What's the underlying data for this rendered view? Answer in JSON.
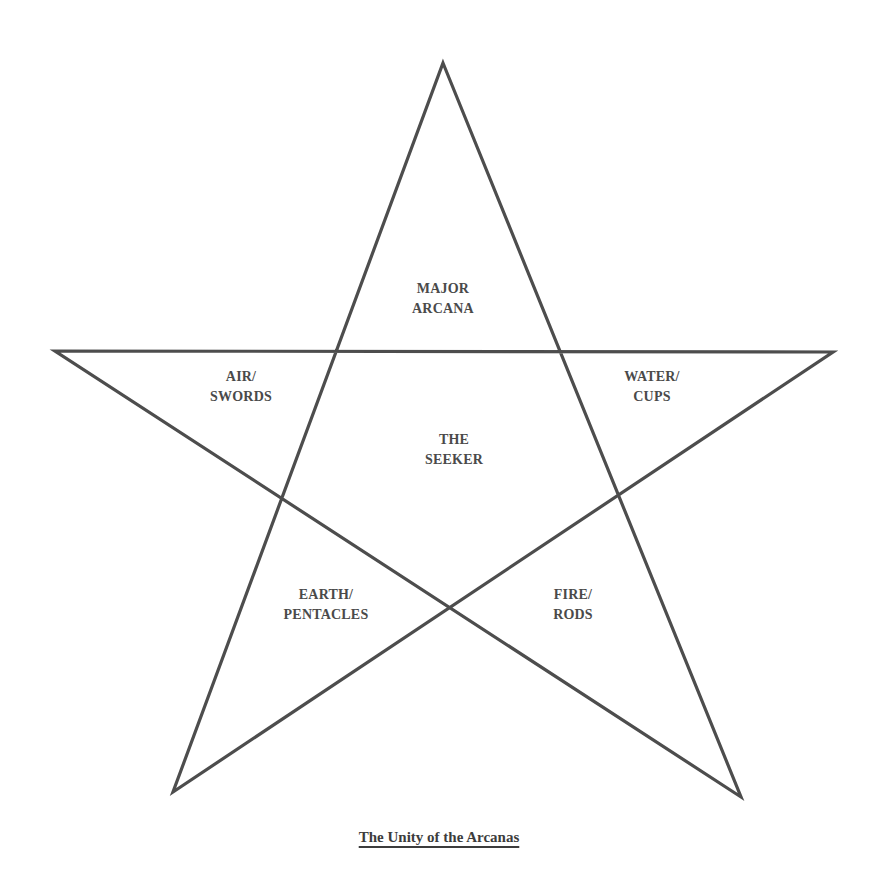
{
  "diagram": {
    "type": "pentagram",
    "stroke_color": "#4d4d4d",
    "text_color": "#4a4a4a",
    "vertices": {
      "top": [
        443,
        63
      ],
      "right": [
        833,
        352
      ],
      "bottom_right": [
        741,
        797
      ],
      "bottom_left": [
        173,
        792
      ],
      "left": [
        55,
        351
      ]
    },
    "regions": {
      "major_arcana": {
        "line1": "MAJOR",
        "line2": "ARCANA"
      },
      "air_swords": {
        "line1": "AIR/",
        "line2": "SWORDS"
      },
      "water_cups": {
        "line1": "WATER/",
        "line2": "CUPS"
      },
      "the_seeker": {
        "line1": "THE",
        "line2": "SEEKER"
      },
      "earth_pentacles": {
        "line1": "EARTH/",
        "line2": "PENTACLES"
      },
      "fire_rods": {
        "line1": "FIRE/",
        "line2": "RODS"
      }
    },
    "caption": "The Unity of the Arcanas"
  }
}
